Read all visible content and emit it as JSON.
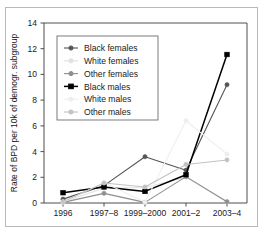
{
  "chart_data": {
    "type": "line",
    "title": "",
    "xlabel": "",
    "ylabel": "Rate of BPD per 10k of demogr. subgroup",
    "categories": [
      "1996",
      "1997–8",
      "1999–2000",
      "2001–2",
      "2003–4"
    ],
    "yticks": [
      0,
      2,
      4,
      6,
      8,
      10,
      12,
      14
    ],
    "ylim": [
      0,
      14
    ],
    "grid": false,
    "legend_position": "upper-left-inside",
    "series": [
      {
        "name": "Black females",
        "color": "#555555",
        "marker": "circle",
        "values": [
          0.3,
          1.35,
          3.6,
          2.55,
          9.2
        ]
      },
      {
        "name": "White females",
        "color": "#e2e2e2",
        "marker": "circle",
        "values": [
          0.1,
          1.15,
          1.2,
          2.0,
          0.1
        ]
      },
      {
        "name": "Other females",
        "color": "#8e8e8e",
        "marker": "circle",
        "values": [
          0.05,
          0.75,
          0.05,
          2.05,
          0.1
        ]
      },
      {
        "name": "Black males",
        "color": "#000000",
        "marker": "square",
        "values": [
          0.8,
          1.25,
          0.9,
          2.2,
          11.55
        ]
      },
      {
        "name": "White males",
        "color": "#eeeeee",
        "marker": "circle",
        "values": [
          0.05,
          1.6,
          0.05,
          6.4,
          3.8
        ]
      },
      {
        "name": "Other males",
        "color": "#c2c2c2",
        "marker": "circle",
        "values": [
          0.1,
          1.55,
          1.25,
          3.0,
          3.35
        ]
      }
    ]
  },
  "axis": {
    "y_title": "Rate of BPD per 10k of demogr. subgroup",
    "tick_0": "0",
    "tick_2": "2",
    "tick_4": "4",
    "tick_6": "6",
    "tick_8": "8",
    "tick_10": "10",
    "tick_12": "12",
    "tick_14": "14",
    "x_1": "1996",
    "x_2": "1997–8",
    "x_3": "1999–2000",
    "x_4": "2001–2",
    "x_5": "2003–4"
  },
  "legend": {
    "item_0": "Black females",
    "item_1": "White females",
    "item_2": "Other females",
    "item_3": "Black males",
    "item_4": "White males",
    "item_5": "Other males"
  }
}
